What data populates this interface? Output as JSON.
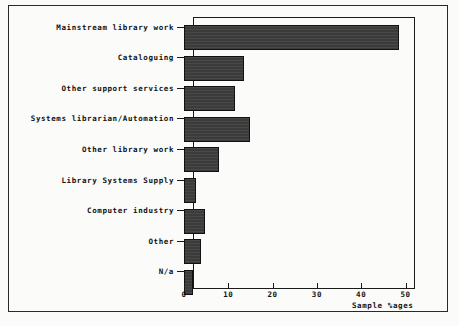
{
  "figure": {
    "x_axis_title": "Sample %ages",
    "x_ticks": [
      "0",
      "10",
      "20",
      "30",
      "40",
      "50"
    ]
  },
  "chart_data": {
    "type": "bar",
    "orientation": "horizontal",
    "title": "",
    "xlabel": "Sample %ages",
    "ylabel": "",
    "xlim": [
      0,
      50
    ],
    "grid": false,
    "legend": false,
    "bar_color": "#3b3b3b",
    "categories": [
      "Mainstream library work",
      "Cataloguing",
      "Other support services",
      "Systems librarian/Automation",
      "Other library work",
      "Library Systems Supply",
      "Computer industry",
      "Other",
      "N/a"
    ],
    "values": [
      48.5,
      13.5,
      11.5,
      15,
      8,
      2.7,
      4.7,
      3.8,
      2
    ],
    "xticks": [
      0,
      10,
      20,
      30,
      40,
      50
    ]
  }
}
